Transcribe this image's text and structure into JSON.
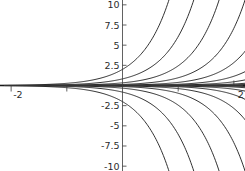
{
  "chart_data": {
    "type": "line",
    "title": "",
    "subtitle": "",
    "xlabel": "",
    "ylabel": "",
    "xlim": [
      -2.2,
      2.2
    ],
    "ylim": [
      -10.6,
      10.6
    ],
    "grid": false,
    "legend": null,
    "axes_style": "centered-cross",
    "x_ticks": [
      {
        "value": -2,
        "label": "-2"
      },
      {
        "value": -1,
        "label": ""
      },
      {
        "value": 1,
        "label": ""
      },
      {
        "value": 2,
        "label": "2"
      }
    ],
    "y_ticks": [
      {
        "value": 10,
        "label": "10"
      },
      {
        "value": 7.5,
        "label": "7.5"
      },
      {
        "value": 5,
        "label": "5"
      },
      {
        "value": 2.5,
        "label": "2.5"
      },
      {
        "value": -2.5,
        "label": "-2.5"
      },
      {
        "value": -5,
        "label": "-5"
      },
      {
        "value": -7.5,
        "label": "-7.5"
      },
      {
        "value": -10,
        "label": "-10"
      }
    ],
    "x_tick_labels": [
      "-2",
      "2"
    ],
    "y_tick_labels": [
      "10",
      "7.5",
      "5",
      "2.5",
      "-2.5",
      "-5",
      "-7.5",
      "-10"
    ],
    "curve_family": {
      "equation": "y = C*e^(k*x)",
      "k": 2,
      "C_values": [
        0.00022,
        0.00055,
        0.0014,
        0.0034,
        0.0085,
        0.021,
        0.052,
        0.13,
        0.33,
        0.82,
        2.0,
        -0.00022,
        -0.00055,
        -0.0014,
        -0.0034,
        -0.0085,
        -0.021,
        -0.052,
        -0.13,
        -0.33,
        -0.82,
        -2.0
      ],
      "n_curves_top_edge": 8,
      "n_curves_bottom_edge": 8,
      "total_curves": 22
    },
    "colors": {
      "background": "#ffffff",
      "curve": "#1a1a1a",
      "axis": "#3a3a3a",
      "tick_text": "#2b2b2b"
    }
  }
}
